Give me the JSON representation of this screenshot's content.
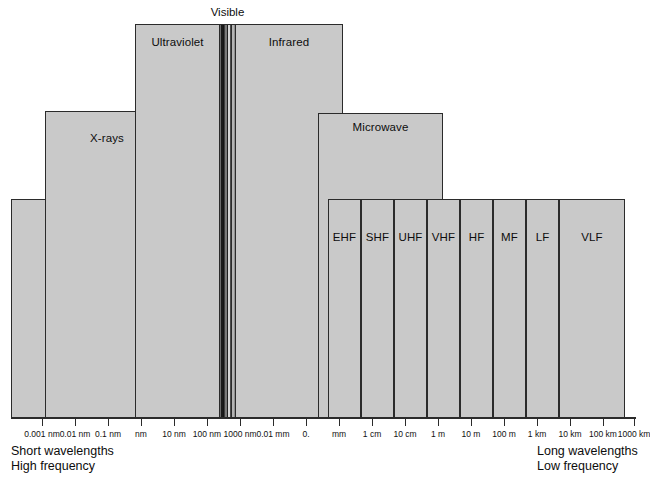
{
  "figure": {
    "type": "electromagnetic-spectrum-diagram",
    "background_color": "#ffffff",
    "band_fill_color": "#c9c9c9",
    "band_border_color": "#2b2b2b"
  },
  "visible": {
    "caption": "Visible",
    "stripe_colors": [
      "#6b6b6b",
      "#1a1a1a",
      "#141414",
      "#3d3d3d",
      "#7a7a7a",
      "#1f1f1f",
      "#d6d6d6",
      "#4a4a4a",
      "#2a2a2a",
      "#b4b4b4",
      "#8f8f8f"
    ]
  },
  "bands": [
    {
      "name": "gamma-rays",
      "label": "Gamma\nrays",
      "x": 11,
      "y": 199,
      "w": 124,
      "h": 219,
      "label_x": 45,
      "label_y": 214,
      "align": "left"
    },
    {
      "name": "x-rays",
      "label": "X-rays",
      "x": 45,
      "y": 111,
      "w": 124,
      "h": 307,
      "label_x": 0,
      "label_y": 132,
      "align": "center"
    },
    {
      "name": "ultraviolet",
      "label": "Ultraviolet",
      "x": 135,
      "y": 24,
      "w": 85,
      "h": 394,
      "label_x": 0,
      "label_y": 36,
      "align": "center"
    },
    {
      "name": "infrared",
      "label": "Infrared",
      "x": 235,
      "y": 24,
      "w": 108,
      "h": 394,
      "label_x": 0,
      "label_y": 36,
      "align": "center"
    },
    {
      "name": "microwave",
      "label": "Microwave",
      "x": 318,
      "y": 113,
      "w": 125,
      "h": 305,
      "label_x": 0,
      "label_y": 121,
      "align": "center"
    }
  ],
  "radio_bands": {
    "top": 199,
    "bottom": 418,
    "label_y": 231,
    "items": [
      {
        "name": "ehf",
        "label": "EHF",
        "x": 328,
        "w": 33
      },
      {
        "name": "shf",
        "label": "SHF",
        "x": 361,
        "w": 33
      },
      {
        "name": "uhf",
        "label": "UHF",
        "x": 394,
        "w": 33
      },
      {
        "name": "vhf",
        "label": "VHF",
        "x": 427,
        "w": 33
      },
      {
        "name": "hf",
        "label": "HF",
        "x": 460,
        "w": 33
      },
      {
        "name": "mf",
        "label": "MF",
        "x": 493,
        "w": 33
      },
      {
        "name": "lf",
        "label": "LF",
        "x": 526,
        "w": 33
      },
      {
        "name": "vlf",
        "label": "VLF",
        "x": 559,
        "w": 66
      }
    ]
  },
  "axis": {
    "y": 417,
    "x_start": 11,
    "x_end": 636,
    "tick_height": 9,
    "tick_label_y": 429,
    "ticks": [
      {
        "x": 42,
        "label": "0.001 nm"
      },
      {
        "x": 75,
        "label": "0.01 nm"
      },
      {
        "x": 108,
        "label": "0.1 nm"
      },
      {
        "x": 141,
        "label": "nm"
      },
      {
        "x": 174,
        "label": "10 nm"
      },
      {
        "x": 207,
        "label": "100 nm"
      },
      {
        "x": 240,
        "label": "1000 nm"
      },
      {
        "x": 273,
        "label": "0.01 mm"
      },
      {
        "x": 306,
        "label": "0."
      },
      {
        "x": 339,
        "label": "mm"
      },
      {
        "x": 372,
        "label": "1 cm"
      },
      {
        "x": 405,
        "label": "10 cm"
      },
      {
        "x": 438,
        "label": "1 m"
      },
      {
        "x": 471,
        "label": "10 m"
      },
      {
        "x": 504,
        "label": "100 m"
      },
      {
        "x": 537,
        "label": "1 km"
      },
      {
        "x": 570,
        "label": "10 km"
      },
      {
        "x": 603,
        "label": "100 km"
      },
      {
        "x": 634,
        "label": "1000 km"
      }
    ]
  },
  "captions": {
    "left": "Short wavelengths\nHigh frequency",
    "right": "Long wavelengths\nLow frequency"
  },
  "chart_data": {
    "type": "bar",
    "xlabel": "Wavelength",
    "ylabel": "",
    "grid": false,
    "legend": "none",
    "categories": [
      "Gamma rays",
      "X-rays",
      "Ultraviolet",
      "Visible",
      "Infrared",
      "Microwave",
      "EHF",
      "SHF",
      "UHF",
      "VHF",
      "HF",
      "MF",
      "LF",
      "VLF"
    ],
    "tick_labels": [
      "0.001 nm",
      "0.01 nm",
      "0.1 nm",
      "nm",
      "10 nm",
      "100 nm",
      "1000 nm",
      "0.01 mm",
      "0.",
      "mm",
      "1 cm",
      "10 cm",
      "1 m",
      "10 m",
      "100 m",
      "1 km",
      "10 km",
      "100 km",
      "1000 km"
    ],
    "annotations": [
      "Visible",
      "Short wavelengths High frequency",
      "Long wavelengths Low frequency"
    ]
  }
}
